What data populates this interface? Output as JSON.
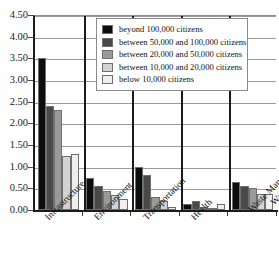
{
  "chart_data": {
    "type": "bar",
    "title": "",
    "xlabel": "",
    "ylabel": "",
    "ylim": [
      0,
      4.5
    ],
    "ytick_step": 0.5,
    "grid": true,
    "legend_position": "top-center-inside",
    "categories": [
      "Infrastructure",
      "Environment",
      "Transportation",
      "Health",
      "Waste Management & Water Resources"
    ],
    "ytick_labels": [
      "0.00",
      "0.50",
      "1.00",
      "1.50",
      "2.00",
      "2.50",
      "3.00",
      "3.50",
      "4.00",
      "4.50"
    ],
    "series": [
      {
        "name": "beyond 100,000 citizens",
        "color": "#0d0d0d",
        "values": [
          3.5,
          0.75,
          1.0,
          0.13,
          0.65
        ]
      },
      {
        "name": "between 50,000 and 100,000 citizens",
        "color": "#4a4a4a",
        "values": [
          2.4,
          0.55,
          0.8,
          0.2,
          0.55
        ]
      },
      {
        "name": "between 20,000 and 50,000 citizens",
        "color": "#9a9a9a",
        "values": [
          2.3,
          0.45,
          0.3,
          0.07,
          0.5
        ]
      },
      {
        "name": "between 10,000 and 20,000 citizens",
        "color": "#d2d2d2",
        "values": [
          1.25,
          0.35,
          0.2,
          0.05,
          0.38
        ]
      },
      {
        "name": "below 10,000 citizens",
        "color": "#efefef",
        "values": [
          1.3,
          0.25,
          0.08,
          0.13,
          0.38
        ]
      }
    ]
  },
  "legend": {
    "items": [
      {
        "label": "beyond 100,000 citizens",
        "color": "#0d0d0d"
      },
      {
        "label": "between 50,000 and 100,000 citizens",
        "color": "#4a4a4a"
      },
      {
        "label": "between 20,000 and 50,000 citizens",
        "color": "#9a9a9a"
      },
      {
        "label": "between 10,000 and 20,000 citizens",
        "color": "#d2d2d2"
      },
      {
        "label": "below 10,000 citizens",
        "color": "#efefef"
      }
    ]
  },
  "axis": {
    "y_max_label": "4.50",
    "y_min_label": "0.00"
  }
}
